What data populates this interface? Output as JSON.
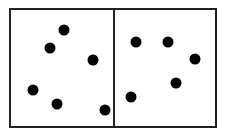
{
  "diagram": {
    "panels": [
      {
        "name": "left",
        "dot_count": 6,
        "dots": [
          [
            64,
            30
          ],
          [
            50,
            48
          ],
          [
            93,
            60
          ],
          [
            33,
            90
          ],
          [
            57,
            104
          ],
          [
            105,
            110
          ]
        ]
      },
      {
        "name": "right",
        "dot_count": 5,
        "dots": [
          [
            136,
            42
          ],
          [
            168,
            42
          ],
          [
            195,
            59
          ],
          [
            176,
            83
          ],
          [
            131,
            97
          ]
        ]
      }
    ],
    "colors": {
      "border": "#222222",
      "dot": "#000000",
      "background": "#ffffff"
    }
  }
}
